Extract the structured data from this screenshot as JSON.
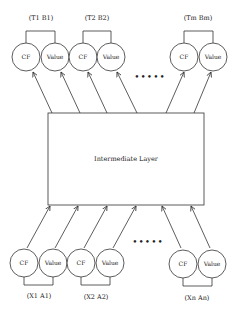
{
  "diagram": {
    "intermediate_layer": {
      "label": "Intermediate Layer"
    },
    "outputs": [
      {
        "label": "(T1 B1)",
        "nodes": [
          "CF",
          "Value"
        ]
      },
      {
        "label": "(T2 B2)",
        "nodes": [
          "CF",
          "Value"
        ]
      },
      {
        "label": "(Tm Bm)",
        "nodes": [
          "CF",
          "Value"
        ]
      }
    ],
    "inputs": [
      {
        "label": "(X1 A1)",
        "nodes": [
          "CF",
          "Value"
        ]
      },
      {
        "label": "(X2 A2)",
        "nodes": [
          "CF",
          "Value"
        ]
      },
      {
        "label": "(Xn An)",
        "nodes": [
          "CF",
          "Value"
        ]
      }
    ],
    "ellipsis": "•••••",
    "stroke_color": "#333333",
    "background": "#ffffff"
  }
}
